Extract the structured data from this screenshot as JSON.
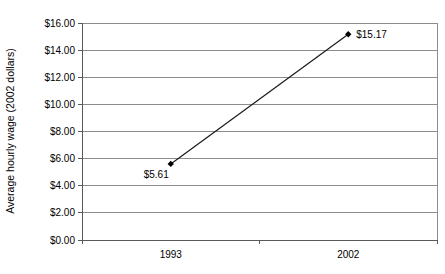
{
  "chart_data": {
    "type": "line",
    "categories": [
      "1993",
      "2002"
    ],
    "series": [
      {
        "name": "Average hourly wage",
        "values": [
          5.61,
          15.17
        ]
      }
    ],
    "point_labels": [
      "$5.61",
      "$15.17"
    ],
    "point_label_positions": [
      "below-left",
      "right"
    ],
    "title": "",
    "xlabel": "",
    "ylabel": "Average hourly wage (2002 dollars)",
    "ylim": [
      0,
      16
    ],
    "ytick_step": 2,
    "ytick_labels": [
      "$0.00",
      "$2.00",
      "$4.00",
      "$6.00",
      "$8.00",
      "$10.00",
      "$12.00",
      "$14.00",
      "$16.00"
    ],
    "grid": true,
    "legend": false,
    "colors": {
      "background": "#ffffff",
      "text": "#000000",
      "gridline": "#8c8c8c",
      "plot_border": "#8c8c8c",
      "axis": "#595959",
      "line": "#1a1a1a",
      "marker": "#000000"
    }
  }
}
